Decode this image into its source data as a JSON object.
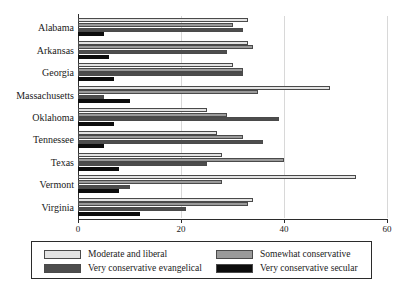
{
  "chart_data": {
    "type": "bar",
    "orientation": "horizontal",
    "title": "",
    "xlabel": "",
    "ylabel": "",
    "xlim": [
      0,
      60
    ],
    "xticks": [
      0,
      20,
      40,
      60
    ],
    "grid": true,
    "grid_axis": "x",
    "legend_position": "bottom",
    "categories": [
      "Alabama",
      "Arkansas",
      "Georgia",
      "Massachusetts",
      "Oklahoma",
      "Tennessee",
      "Texas",
      "Vermont",
      "Virginia"
    ],
    "series": [
      {
        "name": "Moderate and liberal",
        "color": "#e3e3e3",
        "values": [
          33,
          33,
          30,
          49,
          25,
          27,
          28,
          54,
          34
        ]
      },
      {
        "name": "Somewhat conservative",
        "color": "#9a9a9a",
        "values": [
          30,
          34,
          32,
          35,
          29,
          32,
          40,
          28,
          33
        ]
      },
      {
        "name": "Very conservative evangelical",
        "color": "#4d4d4d",
        "values": [
          32,
          29,
          32,
          5,
          39,
          36,
          25,
          10,
          21
        ]
      },
      {
        "name": "Very conservative secular",
        "color": "#0d0d0d",
        "values": [
          5,
          6,
          7,
          10,
          7,
          5,
          8,
          8,
          12
        ]
      }
    ]
  }
}
